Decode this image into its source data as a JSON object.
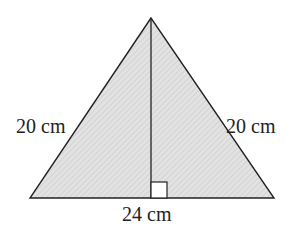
{
  "diagram": {
    "shape": "isosceles triangle",
    "labels": {
      "left_side": "20 cm",
      "right_side": "20 cm",
      "base": "24 cm"
    },
    "right_angle_marker": true,
    "colors": {
      "fill": "#d9d9d9",
      "stroke": "#222222",
      "background": "#ffffff"
    }
  }
}
